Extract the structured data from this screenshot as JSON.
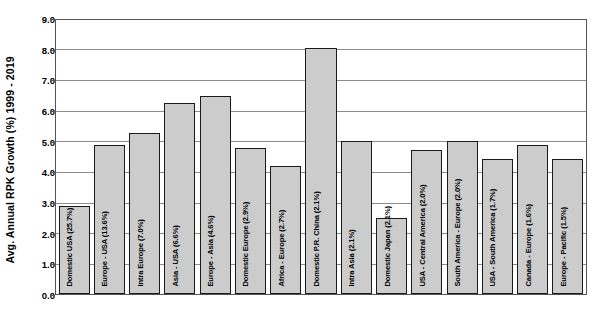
{
  "chart_data": {
    "type": "bar",
    "title": "",
    "xlabel": "",
    "ylabel": "Avg. Annual RPK Growth (%) 1999 - 2019",
    "ylim": [
      0.0,
      9.0
    ],
    "ytick_labels": [
      "9.0",
      "8.0",
      "7.0",
      "6.0",
      "5.0",
      "4.0",
      "3.0",
      "2.0",
      "1.0",
      "0.0"
    ],
    "ytick_values": [
      9.0,
      8.0,
      7.0,
      6.0,
      5.0,
      4.0,
      3.0,
      2.0,
      1.0,
      0.0
    ],
    "grid": true,
    "legend": null,
    "bar_color": "#cccccc",
    "bar_edge_color": "#1a1a1a",
    "categories": [
      "Domestic USA (25.7%)",
      "Europe - USA (13.6%)",
      "Intra Europe (7.0%)",
      "Asia - USA (6.6%)",
      "Europe - Asia (4.6%)",
      "Domestic Europe (2.9%)",
      "Africa - Europe (2.7%)",
      "Domestic P.R. China (2.1%)",
      "Intra Asia (2.1%)",
      "Domestic Japan (2.1%)",
      "USA - Central America (2.0%)",
      "South America - Europe (2.0%)",
      "USA - South America (1.7%)",
      "Canada - Europe (1.6%)",
      "Europe - Pacific (1.5%)"
    ],
    "values": [
      2.9,
      4.9,
      5.3,
      6.3,
      6.5,
      4.8,
      4.2,
      8.1,
      5.05,
      2.5,
      4.75,
      5.05,
      4.45,
      4.9,
      4.45
    ]
  }
}
